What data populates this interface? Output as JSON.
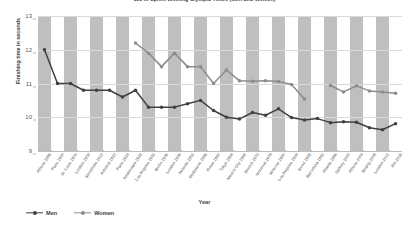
{
  "chart_data": {
    "type": "line",
    "title": "100 m Sprint Winning Olympic Times (Men and Women)",
    "xlabel": "Year",
    "ylabel": "Finishing time in seconds",
    "ylim": [
      9,
      13
    ],
    "yticks": [
      13,
      12,
      11,
      10,
      9
    ],
    "grid": true,
    "legend_position": "bottom-left",
    "categories": [
      "Athens 1896",
      "Paris 1900",
      "St. Louis 1904",
      "London 1908",
      "Stockholm 1912",
      "Antwerp 1920",
      "Paris 1924",
      "Amsterdam 1928",
      "Los Angeles 1932",
      "Berlin 1936",
      "London 1948",
      "Helsinki 1952",
      "Melbourne 1956",
      "Rome 1960",
      "Tokyo 1964",
      "Mexico City 1968",
      "Munich 1972",
      "Montreal 1976",
      "Moscow 1980",
      "Los Angeles 1984",
      "Seoul 1988",
      "Barcelona 1992",
      "Atlanta 1996",
      "Sydney 2000",
      "Athens 2004",
      "Beijing 2008",
      "London 2012",
      "Rio 2016"
    ],
    "series": [
      {
        "name": "Men",
        "color": "#404040",
        "values": [
          12.0,
          11.0,
          11.0,
          10.8,
          10.8,
          10.8,
          10.6,
          10.8,
          10.3,
          10.3,
          10.3,
          10.4,
          10.5,
          10.2,
          10.0,
          9.95,
          10.14,
          10.06,
          10.25,
          9.99,
          9.92,
          9.96,
          9.84,
          9.87,
          9.85,
          9.69,
          9.63,
          9.81
        ]
      },
      {
        "name": "Women",
        "color": "#8c8c8c",
        "values": [
          null,
          null,
          null,
          null,
          null,
          null,
          null,
          12.2,
          11.9,
          11.5,
          11.9,
          11.5,
          11.5,
          11.0,
          11.4,
          11.08,
          11.07,
          11.08,
          11.06,
          10.97,
          10.54,
          null,
          10.94,
          10.75,
          10.93,
          10.78,
          10.75,
          10.71
        ]
      }
    ]
  },
  "legend": {
    "items": [
      {
        "label": "Men",
        "color": "#404040"
      },
      {
        "label": "Women",
        "color": "#8c8c8c"
      }
    ]
  }
}
